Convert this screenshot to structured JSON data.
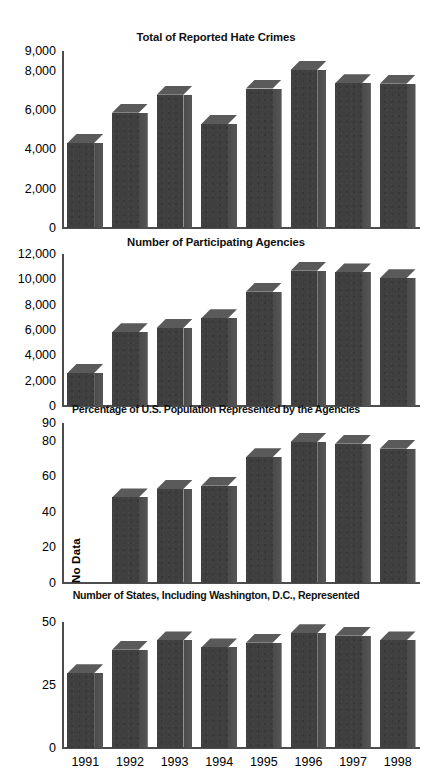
{
  "chart_data": [
    {
      "type": "bar",
      "title": "Total of Reported Hate Crimes",
      "xlabel": "",
      "ylabel": "",
      "categories": [
        "1991",
        "1992",
        "1993",
        "1994",
        "1995",
        "1996",
        "1997",
        "1998"
      ],
      "values": [
        4558,
        6181,
        7137,
        5575,
        7472,
        8465,
        7755,
        7725
      ],
      "ylim": [
        0,
        9000
      ],
      "yticks": [
        0,
        2000,
        4000,
        6000,
        8000,
        9000
      ],
      "yticklabels": [
        "0",
        "2,000",
        "4,000",
        "6,000",
        "8,000",
        "9,000"
      ],
      "grid": false,
      "legend": "none",
      "annotations": []
    },
    {
      "type": "bar",
      "title": "Number of Participating Agencies",
      "xlabel": "",
      "ylabel": "",
      "categories": [
        "1991",
        "1992",
        "1993",
        "1994",
        "1995",
        "1996",
        "1997",
        "1998"
      ],
      "values": [
        2771,
        6181,
        6551,
        7356,
        9584,
        11354,
        11211,
        10730
      ],
      "ylim": [
        0,
        12000
      ],
      "yticks": [
        0,
        2000,
        4000,
        6000,
        8000,
        10000,
        12000
      ],
      "yticklabels": [
        "0",
        "2,000",
        "4,000",
        "6,000",
        "8,000",
        "10,000",
        "12,000"
      ],
      "grid": false,
      "legend": "none",
      "annotations": []
    },
    {
      "type": "bar",
      "title": "Percentage of U.S. Population Represented by the Agencies",
      "xlabel": "",
      "ylabel": "",
      "categories": [
        "1991",
        "1992",
        "1993",
        "1994",
        "1995",
        "1996",
        "1997",
        "1998"
      ],
      "values": [
        null,
        51,
        56,
        58,
        75,
        84,
        83,
        80
      ],
      "ylim": [
        0,
        90
      ],
      "yticks": [
        0,
        20,
        40,
        60,
        80,
        90
      ],
      "yticklabels": [
        "0",
        "20",
        "40",
        "60",
        "80",
        "90"
      ],
      "grid": false,
      "legend": "none",
      "annotations": [
        {
          "text": "No Data",
          "category": "1991",
          "orientation": "vertical"
        }
      ]
    },
    {
      "type": "bar",
      "title": "Number of States, Including Washington, D.C., Represented",
      "xlabel": "",
      "ylabel": "",
      "categories": [
        "1991",
        "1992",
        "1993",
        "1994",
        "1995",
        "1996",
        "1997",
        "1998"
      ],
      "values": [
        32,
        42,
        46,
        43,
        45,
        49,
        48,
        46
      ],
      "ylim": [
        0,
        50
      ],
      "yticks": [
        0,
        25,
        50
      ],
      "yticklabels": [
        "0",
        "25",
        "50"
      ],
      "grid": false,
      "legend": "none",
      "annotations": []
    }
  ],
  "figure": {
    "axis_color": "#4d4d4d",
    "bar_front_color": "#3f3f3f",
    "bar_side_color": "#4f4f4f",
    "bar_top_color": "#585858",
    "background_color": "#ffffff"
  }
}
